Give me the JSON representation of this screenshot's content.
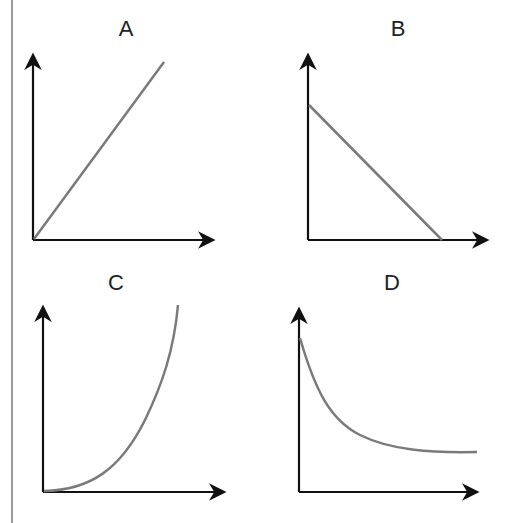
{
  "graphs": [
    {
      "label": "A",
      "shape": "linear-increasing"
    },
    {
      "label": "B",
      "shape": "linear-decreasing"
    },
    {
      "label": "C",
      "shape": "exponential-growth"
    },
    {
      "label": "D",
      "shape": "decay-to-asymptote"
    }
  ],
  "colors": {
    "axis": "#111111",
    "curve": "#7a7a7a",
    "margin_rule": "#9a9a9a"
  }
}
